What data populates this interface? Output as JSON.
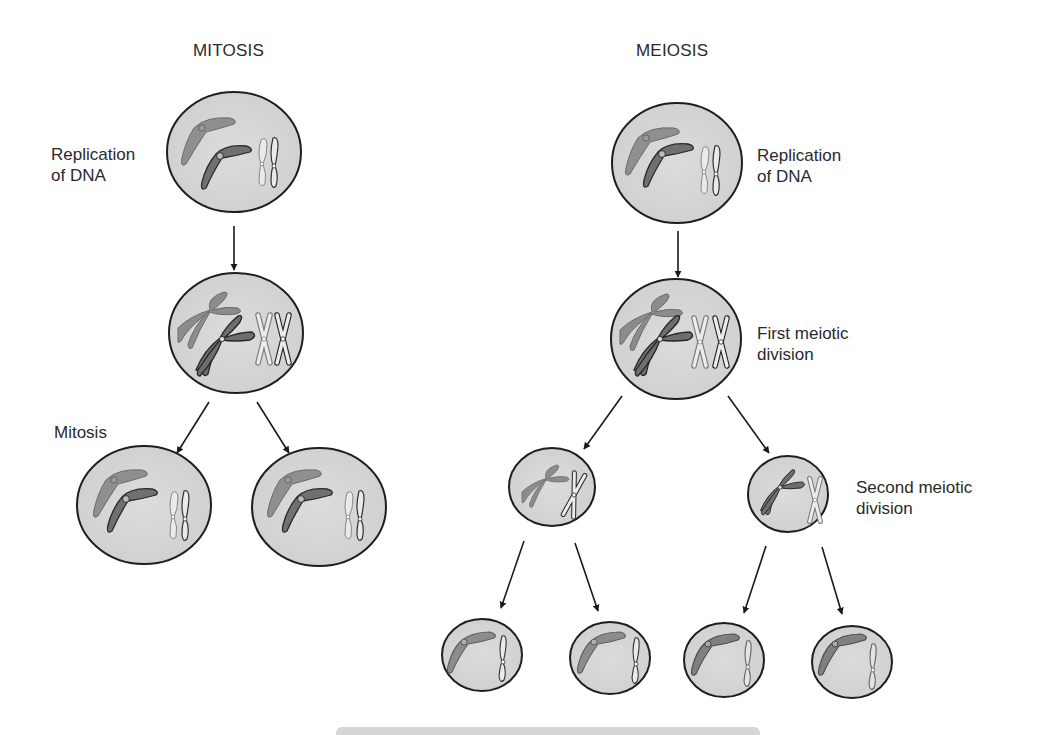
{
  "titles": {
    "mitosis": "MITOSIS",
    "meiosis": "MEIOSIS"
  },
  "labels": {
    "mitosis_replication": "Replication\nof DNA",
    "mitosis_division": "Mitosis",
    "meiosis_replication": "Replication\nof DNA",
    "meiosis_first": "First meiotic\ndivision",
    "meiosis_second": "Second meiotic\ndivision"
  },
  "colors": {
    "cell_fill": "#d4d4d4",
    "cell_stroke": "#1e1e1e",
    "chromosome_light": "#8c8c8c",
    "chromosome_dark": "#6f6f6f",
    "chromosome_outline_fill": "#e4e4e4",
    "arrow": "#1a1a1a"
  },
  "cells": [
    {
      "id": "mitosis-parent",
      "cx": 234,
      "cy": 152,
      "rx": 67,
      "ry": 60,
      "stage": "replicated"
    },
    {
      "id": "mitosis-replicated",
      "cx": 236,
      "cy": 333,
      "rx": 67,
      "ry": 60,
      "stage": "duplicated"
    },
    {
      "id": "mitosis-daughter-left",
      "cx": 144,
      "cy": 505,
      "rx": 67,
      "ry": 59,
      "stage": "diploid"
    },
    {
      "id": "mitosis-daughter-right",
      "cx": 319,
      "cy": 507,
      "rx": 67,
      "ry": 59,
      "stage": "diploid"
    },
    {
      "id": "meiosis-parent",
      "cx": 677,
      "cy": 163,
      "rx": 65,
      "ry": 60,
      "stage": "replicated"
    },
    {
      "id": "meiosis-replicated",
      "cx": 676,
      "cy": 339,
      "rx": 65,
      "ry": 60,
      "stage": "duplicated"
    },
    {
      "id": "meiosis-second-left",
      "cx": 552,
      "cy": 487,
      "rx": 43,
      "ry": 39,
      "stage": "haploid-dup"
    },
    {
      "id": "meiosis-second-right",
      "cx": 788,
      "cy": 494,
      "rx": 40,
      "ry": 38,
      "stage": "haploid-dup"
    },
    {
      "id": "meiosis-gamete-1",
      "cx": 482,
      "cy": 655,
      "rx": 40,
      "ry": 36,
      "stage": "haploid"
    },
    {
      "id": "meiosis-gamete-2",
      "cx": 610,
      "cy": 658,
      "rx": 40,
      "ry": 36,
      "stage": "haploid"
    },
    {
      "id": "meiosis-gamete-3",
      "cx": 724,
      "cy": 660,
      "rx": 40,
      "ry": 37,
      "stage": "haploid"
    },
    {
      "id": "meiosis-gamete-4",
      "cx": 852,
      "cy": 662,
      "rx": 40,
      "ry": 36,
      "stage": "haploid"
    }
  ],
  "arrows": [
    {
      "from": "mitosis-parent",
      "to": "mitosis-replicated",
      "x1": 234,
      "y1": 226,
      "x2": 234,
      "y2": 270
    },
    {
      "from": "mitosis-replicated",
      "to": "mitosis-daughter-left",
      "x1": 209,
      "y1": 402,
      "x2": 177,
      "y2": 453
    },
    {
      "from": "mitosis-replicated",
      "to": "mitosis-daughter-right",
      "x1": 257,
      "y1": 402,
      "x2": 289,
      "y2": 453
    },
    {
      "from": "meiosis-parent",
      "to": "meiosis-replicated",
      "x1": 678,
      "y1": 231,
      "x2": 678,
      "y2": 277
    },
    {
      "from": "meiosis-replicated",
      "to": "meiosis-second-left",
      "x1": 622,
      "y1": 396,
      "x2": 584,
      "y2": 449
    },
    {
      "from": "meiosis-replicated",
      "to": "meiosis-second-right",
      "x1": 728,
      "y1": 396,
      "x2": 769,
      "y2": 453
    },
    {
      "from": "meiosis-second-left",
      "to": "meiosis-gamete-1",
      "x1": 524,
      "y1": 541,
      "x2": 501,
      "y2": 608
    },
    {
      "from": "meiosis-second-left",
      "to": "meiosis-gamete-2",
      "x1": 575,
      "y1": 543,
      "x2": 598,
      "y2": 611
    },
    {
      "from": "meiosis-second-right",
      "to": "meiosis-gamete-3",
      "x1": 766,
      "y1": 546,
      "x2": 744,
      "y2": 613
    },
    {
      "from": "meiosis-second-right",
      "to": "meiosis-gamete-4",
      "x1": 822,
      "y1": 547,
      "x2": 842,
      "y2": 614
    }
  ]
}
